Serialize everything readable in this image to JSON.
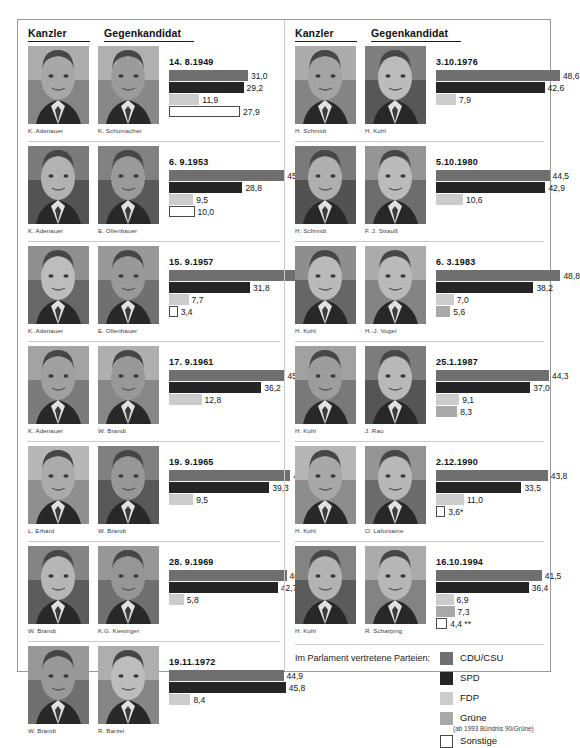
{
  "headers": {
    "chancellor": "Kanzler",
    "challenger": "Gegenkandidat"
  },
  "legend": {
    "title": "Im Parlament vertretene Parteien:",
    "items": [
      {
        "label": "CDU/CSU",
        "sub": "",
        "color": "#6f6f6f",
        "key": "cdu"
      },
      {
        "label": "SPD",
        "sub": "",
        "color": "#252525",
        "key": "spd"
      },
      {
        "label": "FDP",
        "sub": "",
        "color": "#cccccc",
        "key": "fdp"
      },
      {
        "label": "Grüne",
        "sub": "(ab 1993 Bündnis 90/Grüne)",
        "color": "#a9a9a9",
        "key": "gru"
      },
      {
        "label": "Sonstige",
        "sub": "",
        "color": "#ffffff",
        "key": "son"
      }
    ]
  },
  "chart_data": {
    "type": "bar",
    "xlabel": "",
    "ylabel": "Stimmenanteil in Prozent",
    "xlim": [
      0,
      52
    ],
    "grid": false,
    "legend_position": "bottom-right",
    "series": [
      {
        "name": "CDU/CSU",
        "color": "#6f6f6f"
      },
      {
        "name": "SPD",
        "color": "#252525"
      },
      {
        "name": "FDP",
        "color": "#cccccc"
      },
      {
        "name": "Grüne",
        "color": "#a9a9a9"
      },
      {
        "name": "Sonstige",
        "color": "#ffffff"
      }
    ],
    "elections": [
      {
        "date": "14. 8.1949",
        "chancellor": "K. Adenauer",
        "challenger": "K. Schumacher",
        "bars": [
          {
            "party": "cdu",
            "value": 31.0,
            "label": "31,0"
          },
          {
            "party": "spd",
            "value": 29.2,
            "label": "29,2"
          },
          {
            "party": "fdp",
            "value": 11.9,
            "label": "11,9"
          },
          {
            "party": "son",
            "value": 27.9,
            "label": "27,9"
          }
        ]
      },
      {
        "date": "6. 9.1953",
        "chancellor": "K. Adenauer",
        "challenger": "E. Ollenhauer",
        "bars": [
          {
            "party": "cdu",
            "value": 45.2,
            "label": "45,2"
          },
          {
            "party": "spd",
            "value": 28.8,
            "label": "28,8"
          },
          {
            "party": "fdp",
            "value": 9.5,
            "label": "9,5"
          },
          {
            "party": "son",
            "value": 10.0,
            "label": "10,0"
          }
        ]
      },
      {
        "date": "15. 9.1957",
        "chancellor": "K. Adenauer",
        "challenger": "E. Ollenhauer",
        "bars": [
          {
            "party": "cdu",
            "value": 50.2,
            "label": "50,2"
          },
          {
            "party": "spd",
            "value": 31.8,
            "label": "31,8"
          },
          {
            "party": "fdp",
            "value": 7.7,
            "label": "7,7"
          },
          {
            "party": "son",
            "value": 3.4,
            "label": "3,4"
          }
        ]
      },
      {
        "date": "17. 9.1961",
        "chancellor": "K. Adenauer",
        "challenger": "W. Brandt",
        "bars": [
          {
            "party": "cdu",
            "value": 45.3,
            "label": "45,3"
          },
          {
            "party": "spd",
            "value": 36.2,
            "label": "36,2"
          },
          {
            "party": "fdp",
            "value": 12.8,
            "label": "12,8"
          }
        ]
      },
      {
        "date": "19. 9.1965",
        "chancellor": "L. Erhard",
        "challenger": "W. Brandt",
        "bars": [
          {
            "party": "cdu",
            "value": 47.6,
            "label": "47,6"
          },
          {
            "party": "spd",
            "value": 39.3,
            "label": "39,3"
          },
          {
            "party": "fdp",
            "value": 9.5,
            "label": "9,5"
          }
        ]
      },
      {
        "date": "28. 9.1969",
        "chancellor": "W. Brandt",
        "challenger": "K.G. Kiesinger",
        "bars": [
          {
            "party": "cdu",
            "value": 46.1,
            "label": "46,1"
          },
          {
            "party": "spd",
            "value": 42.7,
            "label": "42,7"
          },
          {
            "party": "fdp",
            "value": 5.8,
            "label": "5,8"
          }
        ]
      },
      {
        "date": "19.11.1972",
        "chancellor": "W. Brandt",
        "challenger": "R. Barzel",
        "bars": [
          {
            "party": "cdu",
            "value": 44.9,
            "label": "44,9"
          },
          {
            "party": "spd",
            "value": 45.8,
            "label": "45,8"
          },
          {
            "party": "fdp",
            "value": 8.4,
            "label": "8,4"
          }
        ]
      },
      {
        "date": "3.10.1976",
        "chancellor": "H. Schmidt",
        "challenger": "H. Kohl",
        "bars": [
          {
            "party": "cdu",
            "value": 48.6,
            "label": "48,6"
          },
          {
            "party": "spd",
            "value": 42.6,
            "label": "42,6"
          },
          {
            "party": "fdp",
            "value": 7.9,
            "label": "7,9"
          }
        ]
      },
      {
        "date": "5.10.1980",
        "chancellor": "H. Schmidt",
        "challenger": "F. J. Strauß",
        "bars": [
          {
            "party": "cdu",
            "value": 44.5,
            "label": "44,5"
          },
          {
            "party": "spd",
            "value": 42.9,
            "label": "42,9"
          },
          {
            "party": "fdp",
            "value": 10.6,
            "label": "10,6"
          }
        ]
      },
      {
        "date": "6. 3.1983",
        "chancellor": "H. Kohl",
        "challenger": "H.-J. Vogel",
        "bars": [
          {
            "party": "cdu",
            "value": 48.8,
            "label": "48,8"
          },
          {
            "party": "spd",
            "value": 38.2,
            "label": "38,2"
          },
          {
            "party": "fdp",
            "value": 7.0,
            "label": "7,0"
          },
          {
            "party": "gru",
            "value": 5.6,
            "label": "5,6"
          }
        ]
      },
      {
        "date": "25.1.1987",
        "chancellor": "H. Kohl",
        "challenger": "J. Rau",
        "bars": [
          {
            "party": "cdu",
            "value": 44.3,
            "label": "44,3"
          },
          {
            "party": "spd",
            "value": 37.0,
            "label": "37,0"
          },
          {
            "party": "fdp",
            "value": 9.1,
            "label": "9,1"
          },
          {
            "party": "gru",
            "value": 8.3,
            "label": "8,3"
          }
        ]
      },
      {
        "date": "2.12.1990",
        "chancellor": "H. Kohl",
        "challenger": "O. Lafontaine",
        "bars": [
          {
            "party": "cdu",
            "value": 43.8,
            "label": "43,8"
          },
          {
            "party": "spd",
            "value": 33.5,
            "label": "33,5"
          },
          {
            "party": "fdp",
            "value": 11.0,
            "label": "11,0"
          },
          {
            "party": "son",
            "value": 3.6,
            "label": "3,6*"
          }
        ]
      },
      {
        "date": "16.10.1994",
        "chancellor": "H. Kohl",
        "challenger": "R. Scharping",
        "bars": [
          {
            "party": "cdu",
            "value": 41.5,
            "label": "41,5"
          },
          {
            "party": "spd",
            "value": 36.4,
            "label": "36,4"
          },
          {
            "party": "fdp",
            "value": 6.9,
            "label": "6,9"
          },
          {
            "party": "gru",
            "value": 7.3,
            "label": "7,3"
          },
          {
            "party": "son",
            "value": 4.4,
            "label": "4,4 **"
          }
        ]
      }
    ]
  }
}
